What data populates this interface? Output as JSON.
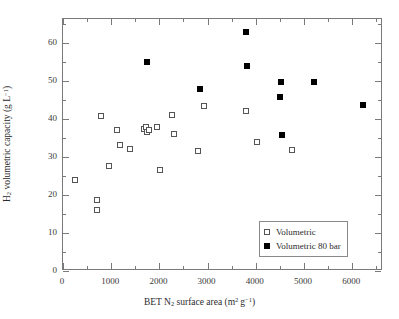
{
  "chart_data": {
    "type": "scatter",
    "title": "",
    "xlabel": "BET N2 surface area (m2 g-1)",
    "ylabel": "H2 volumetric capacity (g L-1)",
    "xlabel_parts": {
      "pre": "BET N",
      "sub1": "2",
      "mid": " surface area (m",
      "sup1": "2",
      "mid2": " g",
      "sup2": "−1",
      "post": ")"
    },
    "ylabel_parts": {
      "pre": "H",
      "sub1": "2",
      "mid": " volumetric capacity (g L",
      "sup1": "−1",
      "post": ")"
    },
    "xlim": [
      0,
      6640
    ],
    "ylim": [
      0,
      66.3
    ],
    "grid": false,
    "xticks": [
      0,
      1000,
      2000,
      3000,
      4000,
      5000,
      6000
    ],
    "xtick_labels": [
      "0",
      "1000",
      "2000",
      "3000",
      "4000",
      "5000",
      "6000"
    ],
    "xticks_minor": [
      500,
      1500,
      2500,
      3500,
      4500,
      5500,
      6500
    ],
    "yticks": [
      0,
      10,
      20,
      30,
      40,
      50,
      60
    ],
    "ytick_labels": [
      "0",
      "10",
      "20",
      "30",
      "40",
      "50",
      "60"
    ],
    "yticks_minor": [
      5,
      15,
      25,
      35,
      45,
      55,
      65
    ],
    "legend_position": "lower-right",
    "series": [
      {
        "name": "Volumetric",
        "marker": "open-square",
        "color": "#555555",
        "points": [
          [
            250,
            23.9
          ],
          [
            700,
            18.6
          ],
          [
            700,
            16.0
          ],
          [
            790,
            40.9
          ],
          [
            960,
            27.7
          ],
          [
            1120,
            37.0
          ],
          [
            1190,
            33.1
          ],
          [
            1390,
            32.1
          ],
          [
            1680,
            37.4
          ],
          [
            1720,
            37.8
          ],
          [
            1740,
            36.7
          ],
          [
            1780,
            37.2
          ],
          [
            1960,
            37.8
          ],
          [
            2010,
            26.7
          ],
          [
            2260,
            41.1
          ],
          [
            2300,
            36.0
          ],
          [
            2800,
            31.6
          ],
          [
            2920,
            43.4
          ],
          [
            3800,
            42.0
          ],
          [
            4020,
            34.0
          ],
          [
            4760,
            31.8
          ]
        ]
      },
      {
        "name": "Volumetric 80 bar",
        "marker": "filled-square",
        "color": "#000000",
        "points": [
          [
            1750,
            54.9
          ],
          [
            2850,
            47.9
          ],
          [
            3800,
            62.8
          ],
          [
            3810,
            53.9
          ],
          [
            4500,
            45.8
          ],
          [
            4520,
            49.8
          ],
          [
            4540,
            35.9
          ],
          [
            5200,
            49.8
          ],
          [
            6230,
            43.7
          ]
        ]
      }
    ]
  },
  "legend": {
    "items": [
      {
        "label": "Volumetric",
        "marker": "open-square"
      },
      {
        "label": "Volumetric 80 bar",
        "marker": "filled-square"
      }
    ]
  }
}
